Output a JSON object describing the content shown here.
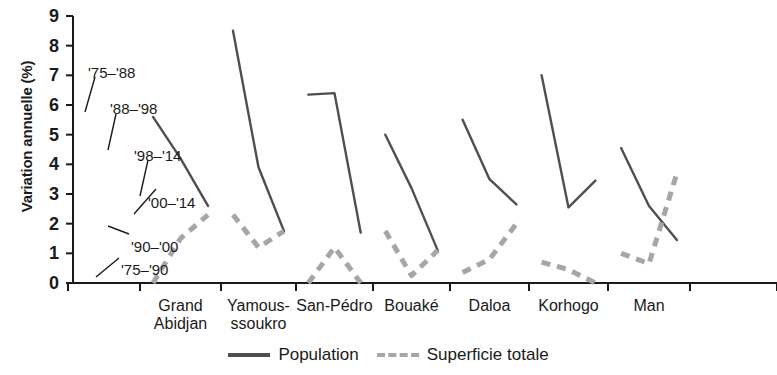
{
  "chart_data": {
    "type": "line",
    "title": "",
    "xlabel": "",
    "ylabel": "Variation annuelle (%)",
    "ylim": [
      0,
      9
    ],
    "yticks": [
      "0",
      "1",
      "2",
      "3",
      "4",
      "5",
      "6",
      "7",
      "8",
      "9"
    ],
    "grid": false,
    "legend_position": "bottom-center",
    "categories": [
      "Grand\nAbidjan",
      "Yamous-\nssoukro",
      "San-Pédro",
      "Bouaké",
      "Daloa",
      "Korhogo",
      "Man"
    ],
    "series": [
      {
        "name": "Population",
        "style": "solid",
        "color": "#4f4f4f",
        "periods": [
          "'75–'88",
          "'88–'98",
          "'98–'14"
        ],
        "groups": [
          {
            "category": "Grand Abidjan",
            "values": [
              5.6,
              4.2,
              2.6
            ]
          },
          {
            "category": "Yamoussoukro",
            "values": [
              8.5,
              3.9,
              1.75
            ]
          },
          {
            "category": "San-Pédro",
            "values": [
              6.35,
              6.4,
              1.7
            ]
          },
          {
            "category": "Bouaké",
            "values": [
              5.0,
              3.2,
              1.1
            ]
          },
          {
            "category": "Daloa",
            "values": [
              5.5,
              3.5,
              2.65
            ]
          },
          {
            "category": "Korhogo",
            "values": [
              7.0,
              2.55,
              3.45
            ]
          },
          {
            "category": "Man",
            "values": [
              4.55,
              2.6,
              1.45
            ]
          }
        ]
      },
      {
        "name": "Superficie totale",
        "style": "dashed",
        "color": "#a6a6a6",
        "periods": [
          "'75–'90",
          "'90–'00",
          "'00–'14"
        ],
        "groups": [
          {
            "category": "Grand Abidjan",
            "values": [
              0.0,
              1.5,
              2.3
            ]
          },
          {
            "category": "Yamoussoukro",
            "values": [
              2.3,
              1.2,
              1.75
            ]
          },
          {
            "category": "San-Pédro",
            "values": [
              0.0,
              1.2,
              0.0
            ]
          },
          {
            "category": "Bouaké",
            "values": [
              1.75,
              0.25,
              1.1
            ]
          },
          {
            "category": "Daloa",
            "values": [
              0.35,
              0.8,
              2.0
            ]
          },
          {
            "category": "Korhogo",
            "values": [
              0.7,
              0.45,
              0.0
            ]
          },
          {
            "category": "Man",
            "values": [
              1.0,
              0.65,
              3.7
            ]
          }
        ]
      }
    ],
    "annotations": [
      {
        "text": "'75–'88",
        "x": 88,
        "y": 65
      },
      {
        "text": "'88–'98",
        "x": 110,
        "y": 101
      },
      {
        "text": "'98–'14",
        "x": 134,
        "y": 148
      },
      {
        "text": "'00–'14",
        "x": 148,
        "y": 195
      },
      {
        "text": "'90–'00",
        "x": 131,
        "y": 239
      },
      {
        "text": "'75–'90",
        "x": 121,
        "y": 262
      }
    ],
    "legend": [
      {
        "label": "Population",
        "style": "solid"
      },
      {
        "label": "Superficie totale",
        "style": "dashed"
      }
    ]
  },
  "geometry": {
    "plot_left": 73,
    "plot_right": 777,
    "plot_top": 16,
    "plot_bottom": 283,
    "group_ticks": [
      68,
      140,
      221,
      296,
      373,
      450,
      529,
      608,
      690,
      777
    ]
  }
}
